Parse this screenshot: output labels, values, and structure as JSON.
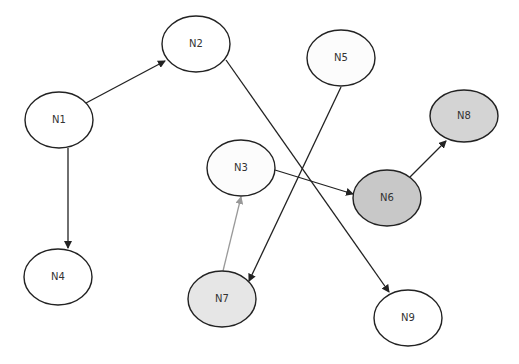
{
  "diagram": {
    "type": "directed-graph",
    "nodes": [
      {
        "id": "N1",
        "label": "N1",
        "cx": 59,
        "cy": 120,
        "rx": 34,
        "ry": 28,
        "fill": "#ffffff"
      },
      {
        "id": "N2",
        "label": "N2",
        "cx": 196,
        "cy": 44,
        "rx": 34,
        "ry": 28,
        "fill": "#ffffff"
      },
      {
        "id": "N3",
        "label": "N3",
        "cx": 241,
        "cy": 168,
        "rx": 34,
        "ry": 28,
        "fill": "#fcfcfc"
      },
      {
        "id": "N4",
        "label": "N4",
        "cx": 58,
        "cy": 277,
        "rx": 34,
        "ry": 28,
        "fill": "#ffffff"
      },
      {
        "id": "N5",
        "label": "N5",
        "cx": 341,
        "cy": 58,
        "rx": 34,
        "ry": 28,
        "fill": "#fcfcfc"
      },
      {
        "id": "N6",
        "label": "N6",
        "cx": 387,
        "cy": 198,
        "rx": 34,
        "ry": 28,
        "fill": "#c8c8c8"
      },
      {
        "id": "N7",
        "label": "N7",
        "cx": 222,
        "cy": 299,
        "rx": 34,
        "ry": 28,
        "fill": "#e6e6e6"
      },
      {
        "id": "N8",
        "label": "N8",
        "cx": 464,
        "cy": 116,
        "rx": 34,
        "ry": 26,
        "fill": "#d4d4d4"
      },
      {
        "id": "N9",
        "label": "N9",
        "cx": 408,
        "cy": 318,
        "rx": 34,
        "ry": 28,
        "fill": "#ffffff"
      }
    ],
    "edges": [
      {
        "from": "N1",
        "to": "N2",
        "x1": 86,
        "y1": 103,
        "x2": 165,
        "y2": 61,
        "color": "#222222"
      },
      {
        "from": "N1",
        "to": "N4",
        "x1": 68,
        "y1": 148,
        "x2": 68,
        "y2": 248,
        "color": "#222222"
      },
      {
        "from": "N2",
        "to": "N9",
        "x1": 226,
        "y1": 60,
        "x2": 389,
        "y2": 292,
        "color": "#222222"
      },
      {
        "from": "N3",
        "to": "N6",
        "x1": 275,
        "y1": 170,
        "x2": 353,
        "y2": 194,
        "color": "#222222"
      },
      {
        "from": "N5",
        "to": "N7",
        "x1": 341,
        "y1": 87,
        "x2": 249,
        "y2": 281,
        "color": "#222222"
      },
      {
        "from": "N7",
        "to": "N3",
        "x1": 223,
        "y1": 271,
        "x2": 241,
        "y2": 197,
        "color": "#999999"
      },
      {
        "from": "N6",
        "to": "N8",
        "x1": 410,
        "y1": 177,
        "x2": 446,
        "y2": 141,
        "color": "#222222"
      }
    ]
  }
}
